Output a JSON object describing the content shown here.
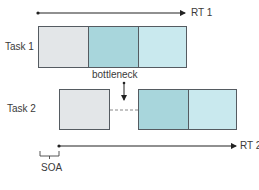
{
  "diagram": {
    "type": "psychological-refractory-period",
    "colors": {
      "perception_stage": "#e3e6e8",
      "bottleneck_stage": "#a8d6dc",
      "response_stage": "#c9e9ee",
      "border": "#555b61",
      "arrow": "#222222"
    },
    "task1": {
      "label": "Task 1",
      "rt_label": "RT 1",
      "stages": [
        "perception",
        "central",
        "response"
      ]
    },
    "task2": {
      "label": "Task 2",
      "rt_label": "RT 2",
      "stages": [
        "perception",
        "wait",
        "central",
        "response"
      ]
    },
    "annotations": {
      "bottleneck": "bottleneck",
      "soa": "SOA"
    }
  }
}
